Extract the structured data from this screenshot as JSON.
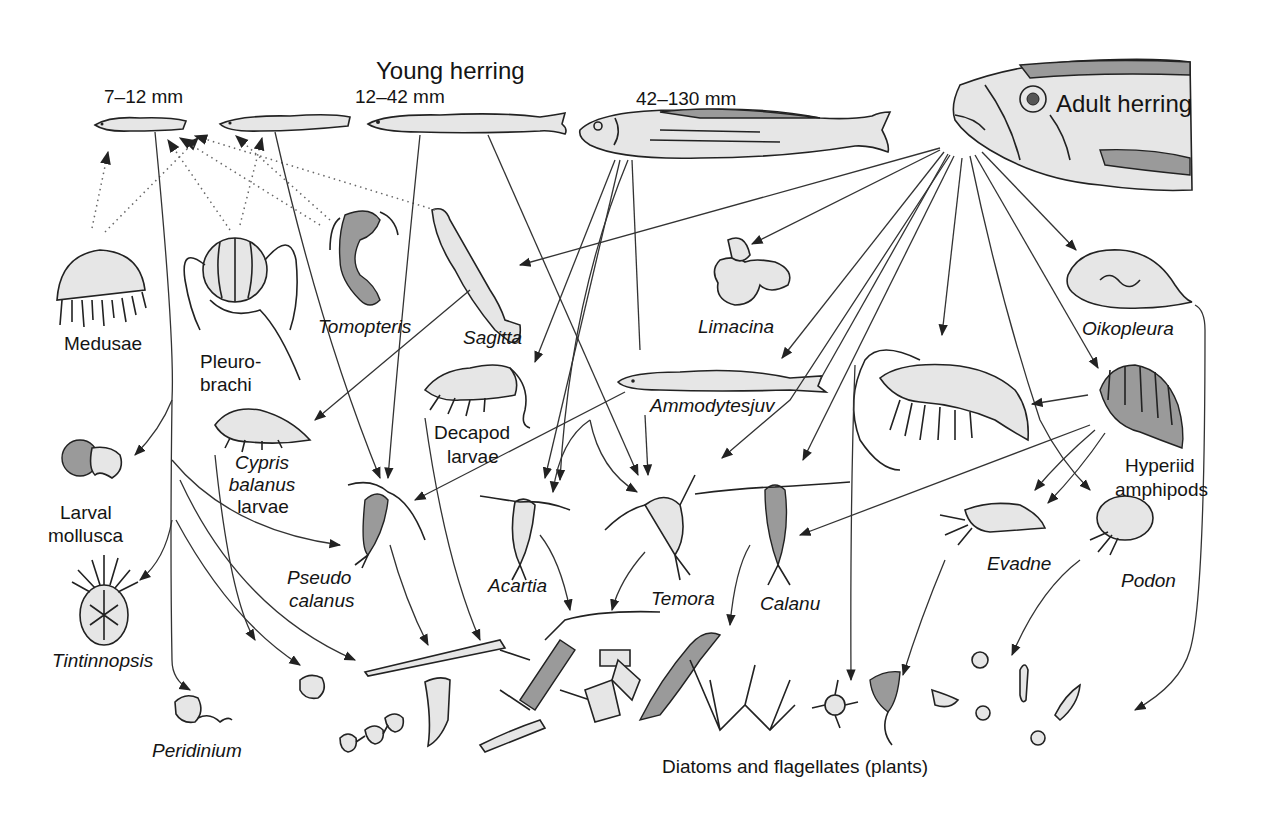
{
  "title": "Young herring",
  "stages": {
    "stage1": "7–12 mm",
    "stage2": "12–42 mm",
    "stage3": "42–130 mm",
    "adult": "Adult herring"
  },
  "organisms": {
    "medusae": "Medusae",
    "pleurobrachia_1": "Pleuro-",
    "pleurobrachia_2": "brachi",
    "tomopteris": "Tomopteris",
    "sagitta": "Sagitta",
    "limacina": "Limacina",
    "oikopleura": "Oikopleura",
    "larval_mollusca_1": "Larval",
    "larval_mollusca_2": "mollusca",
    "cypris_1": "Cypris",
    "cypris_2": "balanus",
    "cypris_3": "larvae",
    "decapod_1": "Decapod",
    "decapod_2": "larvae",
    "ammodytes": "Ammodytesjuv",
    "hyperiid_1": "Hyperiid",
    "hyperiid_2": "amphipods",
    "tintinnopsis": "Tintinnopsis",
    "pseudocalanus_1": "Pseudo",
    "pseudocalanus_2": "calanus",
    "acartia": "Acartia",
    "temora": "Temora",
    "calanus": "Calanu",
    "evadne": "Evadne",
    "podon": "Podon",
    "peridinium": "Peridinium"
  },
  "base": {
    "label": "Diatoms and flagellates (plants)"
  },
  "legend_semantics": {
    "solid_arrow": "feeds on",
    "dotted_arrow": "preys on young herring"
  }
}
